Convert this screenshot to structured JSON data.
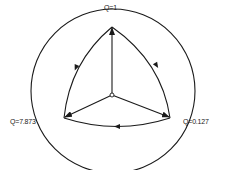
{
  "diagram": {
    "labels": {
      "top": "Q=1",
      "left": "Q=7.873",
      "right": "Q=0.127"
    },
    "colors": {
      "stroke": "#1a1a1a",
      "background": "#ffffff"
    },
    "nodes": [
      {
        "id": "top",
        "label": "Q=1"
      },
      {
        "id": "left",
        "label": "Q=7.873"
      },
      {
        "id": "right",
        "label": "Q=0.127"
      },
      {
        "id": "center",
        "label": ""
      }
    ],
    "edges": [
      {
        "from": "center",
        "to": "top",
        "type": "straight-arrow"
      },
      {
        "from": "center",
        "to": "left",
        "type": "straight-arrow"
      },
      {
        "from": "center",
        "to": "right",
        "type": "straight-arrow"
      },
      {
        "from": "top",
        "to": "right",
        "type": "arc-arrow"
      },
      {
        "from": "right",
        "to": "left",
        "type": "arc-arrow"
      },
      {
        "from": "top",
        "to": "left",
        "type": "arc-arrow"
      }
    ]
  }
}
